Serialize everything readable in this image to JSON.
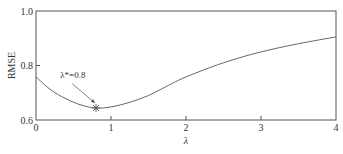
{
  "chart_data": {
    "type": "line",
    "title": "",
    "xlabel": "λ",
    "ylabel": "RMSE",
    "xlim": [
      0,
      4
    ],
    "ylim": [
      0.6,
      1.0
    ],
    "x_ticks": [
      0,
      1,
      2,
      3,
      4
    ],
    "x_tick_labels": [
      "0",
      "1",
      "2",
      "3",
      "4"
    ],
    "y_ticks": [
      0.6,
      0.8,
      1.0
    ],
    "y_tick_labels": [
      "0.6",
      "0.8",
      "1.0"
    ],
    "grid": false,
    "legend": null,
    "series": [
      {
        "name": "RMSE",
        "x": [
          0,
          0.2,
          0.4,
          0.6,
          0.8,
          1.0,
          1.25,
          1.5,
          1.75,
          2.0,
          2.5,
          3.0,
          3.5,
          4.0
        ],
        "values": [
          0.758,
          0.71,
          0.678,
          0.655,
          0.644,
          0.648,
          0.665,
          0.69,
          0.725,
          0.758,
          0.81,
          0.85,
          0.88,
          0.905
        ]
      }
    ],
    "annotations": [
      {
        "text": "λ*=0.8",
        "x": 0.8,
        "y": 0.644,
        "marker": "asterisk",
        "arrow": true,
        "text_x": 0.35,
        "text_y": 0.755
      }
    ]
  },
  "colors": {
    "axis": "#555555",
    "line": "#666666",
    "text": "#333333"
  }
}
